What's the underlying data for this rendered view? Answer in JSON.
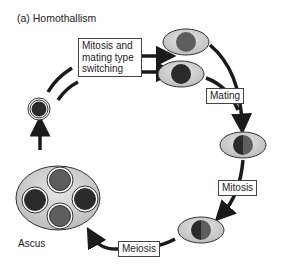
{
  "title": "(a)  Homothallism",
  "labels": {
    "mitosis_switching": [
      "Mitosis and",
      "mating type",
      "switching"
    ],
    "mating": "Mating",
    "mitosis": "Mitosis",
    "meiosis": "Meiosis",
    "ascus": "Ascus"
  },
  "colors": {
    "cell_fill": "#d6d6d6",
    "nucleus_dark": "#2b2b2b",
    "nucleus_grey": "#5e5e5e",
    "arrow": "#1a1a1a"
  }
}
